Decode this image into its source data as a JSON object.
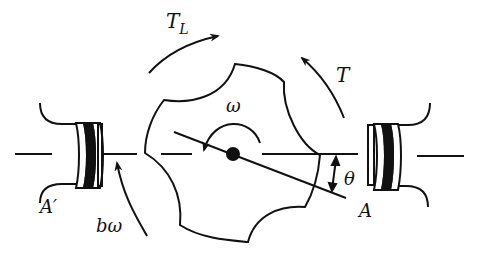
{
  "diagram": {
    "labels": {
      "load_torque": "T",
      "load_torque_sub": "L",
      "motor_torque": "T",
      "angular_velocity": "ω",
      "damping": "bω",
      "angle": "θ",
      "coil_right": "A",
      "coil_left": "A′"
    },
    "colors": {
      "ink": "#111111",
      "background": "#ffffff"
    }
  }
}
